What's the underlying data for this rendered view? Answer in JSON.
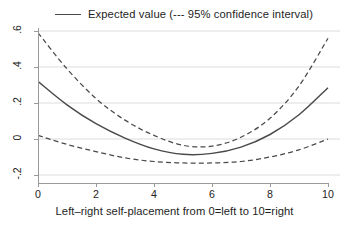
{
  "legend": {
    "label": "Expected value (--- 95% confidence interval)",
    "swatch_name": "solid-line-sample"
  },
  "axes": {
    "y_ticks": [
      ".6",
      ".4",
      ".2",
      "0",
      "-.2"
    ],
    "x_ticks": [
      "0",
      "2",
      "4",
      "6",
      "8",
      "10"
    ],
    "x_title": "Left–right self-placement from 0=left to 10=right",
    "y_title": ""
  },
  "colors": {
    "line": "#4a4a4a",
    "ci": "#4a4a4a",
    "grid": "#dcdcdc",
    "axis": "#9a9a9a",
    "text": "#1d1d1d",
    "background": "#ffffff"
  },
  "chart_data": {
    "type": "line",
    "title": "",
    "subtitle": "",
    "xlabel": "Left–right self-placement from 0=left to 10=right",
    "ylabel": "",
    "xlim": [
      0,
      10
    ],
    "ylim": [
      -0.23,
      0.63
    ],
    "grid": "horizontal",
    "legend_position": "top-center",
    "x": [
      0,
      1,
      2,
      3,
      4,
      5,
      6,
      7,
      8,
      9,
      10
    ],
    "series": [
      {
        "name": "Expected value",
        "style": "solid",
        "values": [
          0.32,
          0.19,
          0.085,
          0.005,
          -0.055,
          -0.085,
          -0.08,
          -0.045,
          0.025,
          0.135,
          0.285
        ]
      },
      {
        "name": "95% confidence interval (upper)",
        "style": "dashed",
        "values": [
          0.59,
          0.39,
          0.225,
          0.105,
          0.02,
          -0.035,
          -0.04,
          0.01,
          0.115,
          0.295,
          0.56
        ]
      },
      {
        "name": "95% confidence interval (lower)",
        "style": "dashed",
        "values": [
          0.02,
          -0.03,
          -0.07,
          -0.105,
          -0.125,
          -0.133,
          -0.133,
          -0.125,
          -0.1,
          -0.06,
          0.0
        ]
      }
    ],
    "annotations": [
      "Dashed curves denote the 95% confidence interval around the expected value."
    ]
  }
}
